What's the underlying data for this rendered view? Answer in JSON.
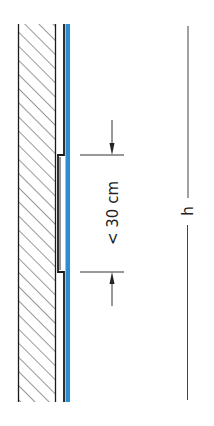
{
  "diagram": {
    "title_cropped": "",
    "gap_dimension_label": "< 30 cm",
    "height_dimension_label": "h",
    "colors": {
      "line": "#1a1a1a",
      "hatch": "#333333",
      "accent_blue": "#2b8fd6",
      "background": "#ffffff"
    },
    "components": [
      "hatched-wall",
      "cladding-panel",
      "blue-membrane",
      "gap-dimension",
      "height-dimension"
    ]
  }
}
